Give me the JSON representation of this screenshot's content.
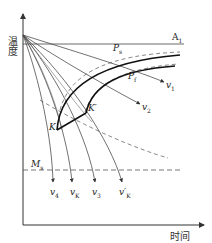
{
  "diagram": {
    "type": "CCT continuous cooling transformation diagram",
    "axes": {
      "y_label": "温度",
      "x_label": "时间"
    },
    "reference_lines": {
      "a1": {
        "label": "A",
        "sub": "1"
      },
      "ms": {
        "label": "M",
        "sub": "s"
      }
    },
    "transformation_curves": {
      "ps": {
        "label": "P",
        "sub": "s"
      },
      "pf": {
        "label": "P",
        "sub": "f"
      }
    },
    "points": {
      "k": {
        "label": "K"
      },
      "k_prime": {
        "label": "K′"
      }
    },
    "cooling_curves": [
      {
        "id": "v1",
        "label": "v",
        "sub": "1"
      },
      {
        "id": "v2",
        "label": "v",
        "sub": "2"
      },
      {
        "id": "v3",
        "label": "v",
        "sub": "3"
      },
      {
        "id": "vk_prime",
        "label": "v′",
        "sub": "K"
      },
      {
        "id": "vk",
        "label": "v",
        "sub": "K"
      },
      {
        "id": "v4",
        "label": "v",
        "sub": "4"
      }
    ],
    "colors": {
      "line": "#333333",
      "thick": "#111111",
      "dashed": "#555555",
      "background": "#ffffff"
    }
  }
}
